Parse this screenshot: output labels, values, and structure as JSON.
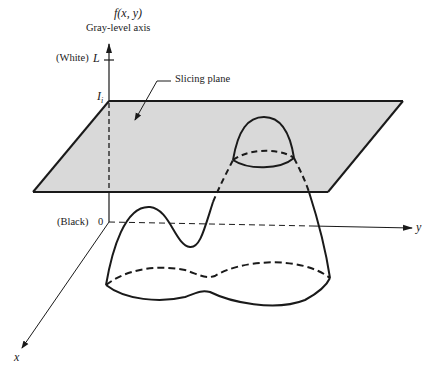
{
  "figure": {
    "function_label": "f(x, y)",
    "axis_title": "Gray-level axis",
    "white_label": "(White)",
    "white_value": "L",
    "level_label": "I",
    "level_subscript": "i",
    "slicing_plane_label": "Slicing plane",
    "black_label": "(Black)",
    "black_value": "0",
    "y_axis_label": "y",
    "x_axis_label": "x"
  },
  "colors": {
    "plane_fill": "#d9d9d9",
    "stroke": "#1a1a1a",
    "background": "#ffffff"
  }
}
